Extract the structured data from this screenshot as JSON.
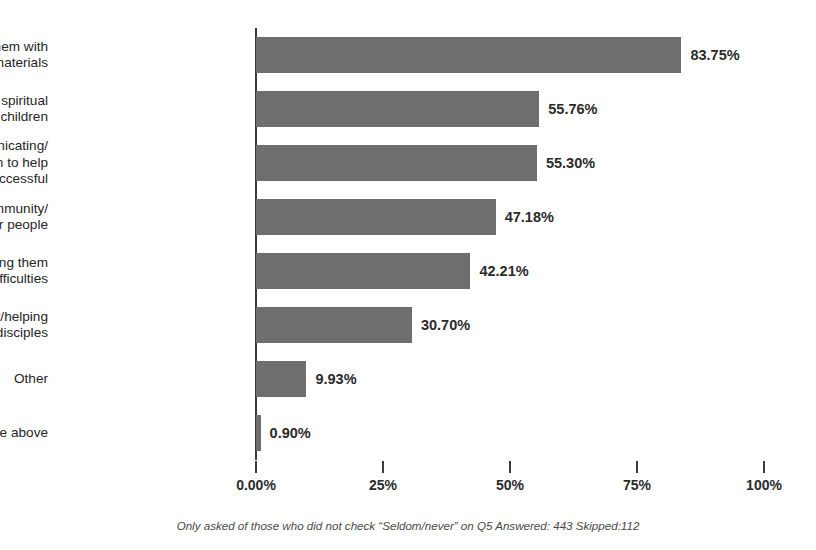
{
  "chart_data": {
    "type": "bar",
    "orientation": "horizontal",
    "title": "",
    "subtitle": "",
    "xlabel": "",
    "ylabel": "",
    "xlim": [
      0,
      100
    ],
    "grid": false,
    "legend": null,
    "categories": [
      "Providing them with\nresources/materials",
      "Teaching them to have spiritual\nconversations with their children",
      "Spending time communicating/\ncollaborating with them to help\nthem be successful",
      "Involving them in community/\nconnection with other people",
      "Counseling/coaching them\nthrough difficulties",
      "Training them spiritually/helping\nthem develop as disciples",
      "Other",
      "None of the above"
    ],
    "values": [
      83.75,
      55.76,
      55.3,
      47.18,
      42.21,
      30.7,
      9.93,
      0.9
    ],
    "value_labels": [
      "83.75%",
      "55.76%",
      "55.30%",
      "47.18%",
      "42.21%",
      "30.70%",
      "9.93%",
      "0.90%"
    ],
    "xticks": [
      0,
      25,
      50,
      75,
      100
    ],
    "xtick_labels": [
      "0.00%",
      "25%",
      "50%",
      "75%",
      "100%"
    ],
    "bar_color": "#6e6e6e",
    "axis_color": "#3b3b3b",
    "text_color": "#2b2b2b",
    "background": "#ffffff"
  },
  "footnote": {
    "text": "Only asked of those who did not check “Seldom/never” on Q5  Answered: 443  Skipped:112"
  }
}
